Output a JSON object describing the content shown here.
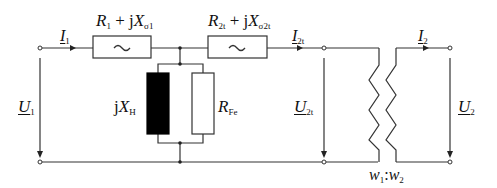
{
  "diagram": {
    "type": "transformer equivalent circuit",
    "labels": {
      "I1": {
        "main": "I",
        "sub": "1"
      },
      "I2t": {
        "main": "I",
        "sub": "2t"
      },
      "I2": {
        "main": "I",
        "sub": "2"
      },
      "U1": {
        "main": "U",
        "sub": "1"
      },
      "U2t": {
        "main": "U",
        "sub": "2t"
      },
      "U2": {
        "main": "U",
        "sub": "2"
      },
      "Z1": {
        "r": "R",
        "r_sub": "1",
        "plus": " + j",
        "x": "X",
        "x_sub": "σ1"
      },
      "Z2t": {
        "r": "R",
        "r_sub": "2t",
        "plus": " + j",
        "x": "X",
        "x_sub": "σ2t"
      },
      "XH": {
        "j": "j",
        "x": "X",
        "x_sub": "H"
      },
      "RFe": {
        "r": "R",
        "r_sub": "Fe"
      },
      "ratio": {
        "w1": "w",
        "w1_sub": "1",
        "sep": ":",
        "w2": "w",
        "w2_sub": "2"
      }
    },
    "impedance_symbol": "~",
    "colors": {
      "wire": "#333333",
      "fill_black": "#000000",
      "background": "#ffffff"
    }
  }
}
